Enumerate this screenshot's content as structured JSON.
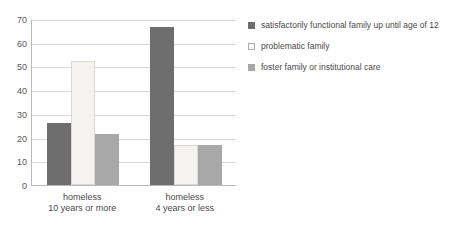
{
  "chart_data": {
    "type": "bar",
    "title": "",
    "subtitle": "",
    "xlabel": "",
    "ylabel": "",
    "ylim": [
      0,
      70
    ],
    "ytick_labels": [
      "0",
      "10",
      "20",
      "30",
      "40",
      "50",
      "60",
      "70"
    ],
    "ytick_values": [
      0,
      10,
      20,
      30,
      40,
      50,
      60,
      70
    ],
    "grid": true,
    "legend_position": "right",
    "categories": [
      {
        "line1": "homeless",
        "line2": "10 years or more"
      },
      {
        "line1": "homeless",
        "line2": "4 years or less"
      }
    ],
    "series": [
      {
        "name": "satisfactorily functional family up until age of 12",
        "color": "#6e6e6e",
        "values": [
          26,
          66.5
        ]
      },
      {
        "name": "problematic family",
        "color": "#f4f3ef",
        "values": [
          52.5,
          16.7
        ]
      },
      {
        "name": "foster family or institutional care",
        "color": "#a8a8a8",
        "values": [
          21.5,
          16.8
        ]
      }
    ]
  }
}
